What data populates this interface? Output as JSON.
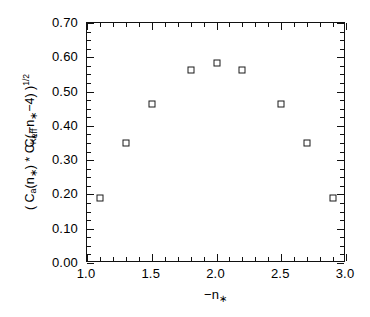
{
  "chart_data": {
    "type": "scatter",
    "title": "",
    "xlabel": "-n*",
    "ylabel": "( C_a(n*) * C_K(-n*-4) )^1/2",
    "ylabel_secondary": "C_eff",
    "xlim": [
      1.0,
      3.0
    ],
    "ylim": [
      0.0,
      0.7
    ],
    "grid": false,
    "legend": null,
    "marker": "open-square",
    "x_major_ticks": [
      1.0,
      1.5,
      2.0,
      2.5,
      3.0
    ],
    "x_tick_labels": [
      "1.0",
      "1.5",
      "2.0",
      "2.5",
      "3.0"
    ],
    "x_minor_step": 0.1,
    "y_major_ticks": [
      0.0,
      0.1,
      0.2,
      0.3,
      0.4,
      0.5,
      0.6,
      0.7
    ],
    "y_tick_labels": [
      "0.00",
      "0.10",
      "0.20",
      "0.30",
      "0.40",
      "0.50",
      "0.60",
      "0.70"
    ],
    "y_minor_step": 0.025,
    "x": [
      1.1,
      1.3,
      1.5,
      1.8,
      2.0,
      2.2,
      2.5,
      2.7,
      2.9
    ],
    "values": [
      0.19,
      0.35,
      0.465,
      0.563,
      0.583,
      0.562,
      0.463,
      0.35,
      0.19
    ],
    "points": [
      {
        "x": 1.1,
        "y": 0.19
      },
      {
        "x": 1.3,
        "y": 0.35
      },
      {
        "x": 1.5,
        "y": 0.465
      },
      {
        "x": 1.8,
        "y": 0.563
      },
      {
        "x": 2.0,
        "y": 0.583
      },
      {
        "x": 2.2,
        "y": 0.562
      },
      {
        "x": 2.5,
        "y": 0.463
      },
      {
        "x": 2.7,
        "y": 0.35
      },
      {
        "x": 2.9,
        "y": 0.19
      }
    ]
  },
  "axis_titles": {
    "x": {
      "minus": "−",
      "symbol": "n",
      "subscript": "∗"
    },
    "y_expression": {
      "open_paren": "( ",
      "c_a": "C",
      "c_a_sub": "a",
      "arg1_open": "(n",
      "arg1_star": "∗",
      "arg1_close": ")",
      "times": " * ",
      "c_k": "C",
      "c_k_sub": "K",
      "arg2_open": "(−n",
      "arg2_star": "∗",
      "arg2_rest": "−4",
      "arg2_close": ")",
      "close_paren": " )",
      "exponent": "1/2"
    },
    "y_secondary": {
      "symbol": "C",
      "subscript": "eff"
    }
  },
  "colors": {
    "axis": "#111111",
    "marker_stroke": "#1a1a1a",
    "background": "#ffffff"
  }
}
